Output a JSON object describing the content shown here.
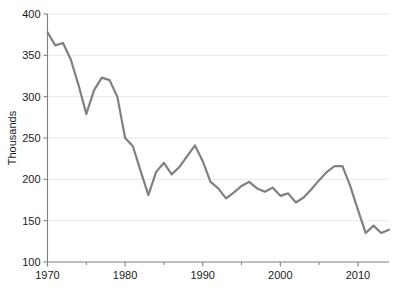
{
  "chart_data": {
    "type": "line",
    "title": "",
    "xlabel": "",
    "ylabel": "Thousands",
    "xlim": [
      1970,
      2014
    ],
    "ylim": [
      100,
      400
    ],
    "ytick_values": [
      100,
      150,
      200,
      250,
      300,
      350,
      400
    ],
    "ytick_labels": [
      "100",
      "150",
      "200",
      "250",
      "300",
      "350",
      "400"
    ],
    "xtick_values": [
      1970,
      1980,
      1990,
      2000,
      2010
    ],
    "xtick_labels": [
      "1970",
      "1980",
      "1990",
      "2000",
      "2010"
    ],
    "xminor_tick_values": [
      1975,
      1985,
      1995,
      2005
    ],
    "grid": "horizontal",
    "legend": "none",
    "series": [
      {
        "name": "",
        "color": "#808080",
        "line_width": 2.2,
        "x": [
          1970,
          1971,
          1972,
          1973,
          1974,
          1975,
          1976,
          1977,
          1978,
          1979,
          1980,
          1981,
          1982,
          1983,
          1984,
          1985,
          1986,
          1987,
          1988,
          1989,
          1990,
          1991,
          1992,
          1993,
          1994,
          1995,
          1996,
          1997,
          1998,
          1999,
          2000,
          2001,
          2002,
          2003,
          2004,
          2005,
          2006,
          2007,
          2008,
          2009,
          2010,
          2011,
          2012,
          2013,
          2014
        ],
        "values": [
          378,
          362,
          365,
          345,
          314,
          279,
          308,
          323,
          320,
          300,
          250,
          240,
          210,
          181,
          209,
          220,
          206,
          215,
          228,
          241,
          222,
          197,
          189,
          177,
          184,
          192,
          197,
          189,
          185,
          190,
          180,
          183,
          172,
          178,
          188,
          199,
          209,
          216,
          216,
          192,
          163,
          135,
          144,
          135,
          139
        ]
      }
    ]
  },
  "axes": {
    "ylabel": "Thousands"
  },
  "colors": {
    "line": "#808080",
    "grid": "#e8e8e8",
    "axis": "#808080",
    "text": "#1a1a1a"
  }
}
